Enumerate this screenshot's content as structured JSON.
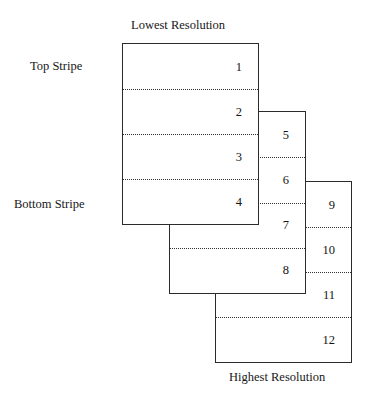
{
  "figure": {
    "caption_top": "Lowest Resolution",
    "caption_bottom": "Highest Resolution",
    "side_label_top": "Top Stripe",
    "side_label_bottom": "Bottom Stripe",
    "line_color": "#2b2b2b",
    "dotted_color": "#2f2f2f",
    "background": "#ffffff",
    "boxes": [
      {
        "name": "lowest-resolution-frame",
        "stripes": [
          {
            "number": "1"
          },
          {
            "number": "2"
          },
          {
            "number": "3"
          },
          {
            "number": "4"
          }
        ]
      },
      {
        "name": "middle-resolution-frame",
        "stripes": [
          {
            "number": "5"
          },
          {
            "number": "6"
          },
          {
            "number": "7"
          },
          {
            "number": "8"
          }
        ]
      },
      {
        "name": "highest-resolution-frame",
        "stripes": [
          {
            "number": "9"
          },
          {
            "number": "10"
          },
          {
            "number": "11"
          },
          {
            "number": "12"
          }
        ]
      }
    ]
  }
}
